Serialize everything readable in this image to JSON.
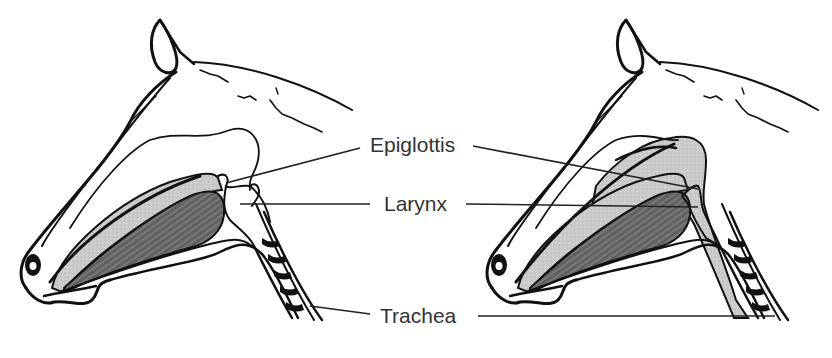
{
  "diagram": {
    "panels": [
      {
        "id": "left",
        "state": "normal",
        "soft_palate_shading": "none"
      },
      {
        "id": "right",
        "state": "displaced",
        "soft_palate_shading": "stippled"
      }
    ],
    "labels": [
      {
        "id": "epiglottis",
        "text": "Epiglottis"
      },
      {
        "id": "larynx",
        "text": "Larynx"
      },
      {
        "id": "trachea",
        "text": "Trachea"
      }
    ],
    "colors": {
      "background": "#ffffff",
      "outline": "#111111",
      "label_text": "#333333",
      "leader_line": "#222222",
      "nasal_stipple": "#c9c9c9",
      "tongue": "#6b6b6b"
    }
  }
}
